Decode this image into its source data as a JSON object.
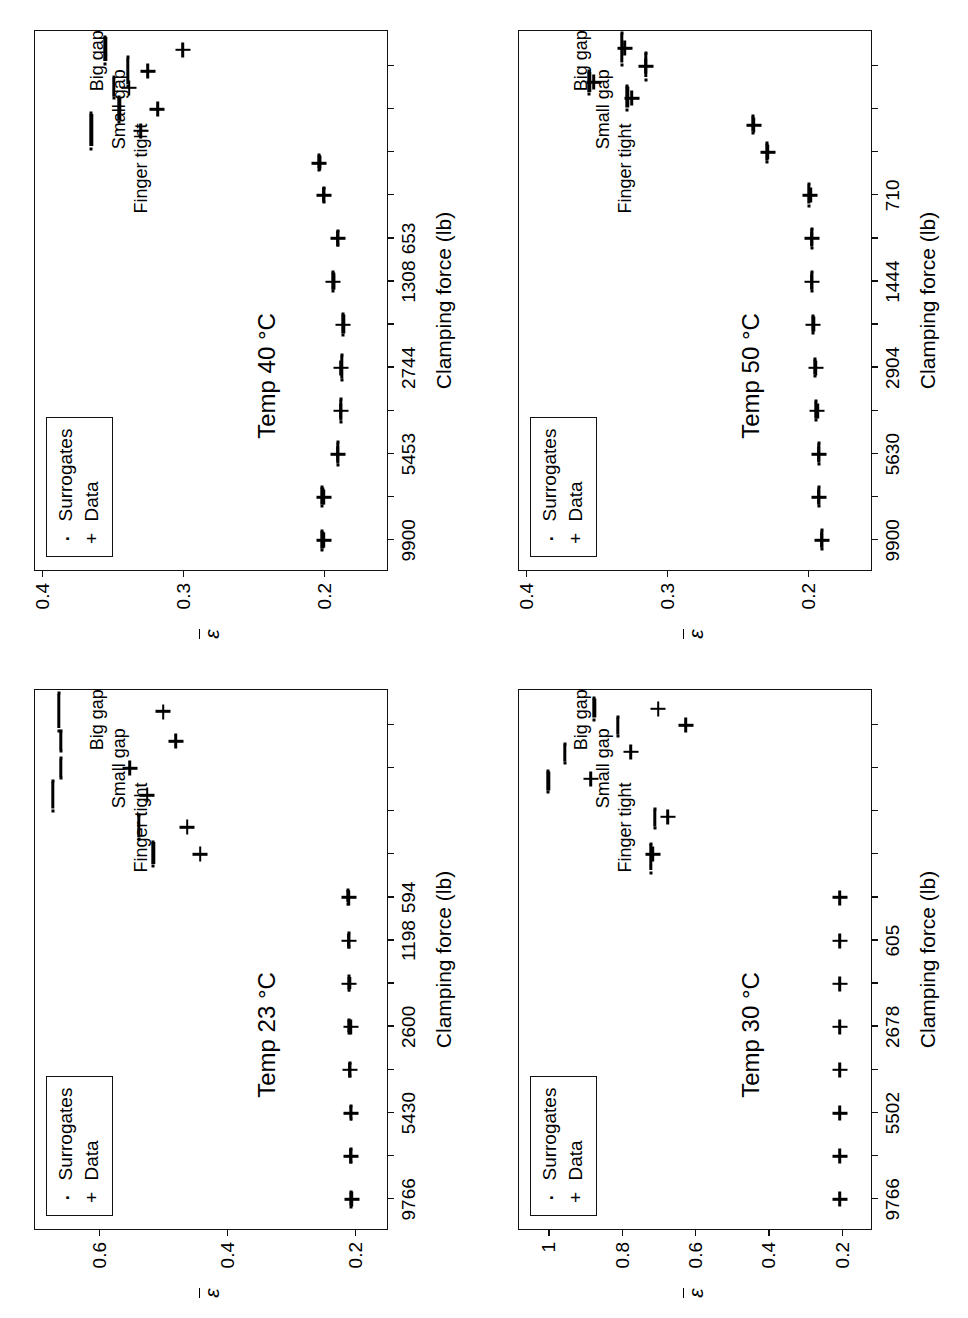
{
  "figure": {
    "layout": "2x2 grid of scatter panels, page rotated 90 degrees",
    "axis_title_x": "Clamping force (lb)",
    "axis_title_y": "ε",
    "legend": {
      "surrogates_label": "Surrogates",
      "data_label": "Data",
      "surrogates_marker": "dot-marker-icon",
      "data_marker": "plus-marker-icon"
    },
    "annotations": {
      "finger_tight": "Finger tight",
      "small_gap": "Small gap",
      "big_gap": "Big gap"
    }
  },
  "chart_data": [
    {
      "id": "temp-30",
      "type": "scatter",
      "title": "Temp 30 °C",
      "xlabel": "Clamping force (lb)",
      "ylabel": "ε",
      "grid": false,
      "legend_position": "top-left",
      "x_tick_labels": [
        "9766",
        "5502",
        "2678",
        "605"
      ],
      "x_tick_positions": [
        0.055,
        0.215,
        0.375,
        0.535
      ],
      "y_tick_labels": [
        "1",
        "0.8",
        "0.6",
        "0.4",
        "0.2"
      ],
      "ylim": [
        0.12,
        1.08
      ],
      "series": [
        {
          "name": "Data",
          "points": [
            {
              "x": 0.055,
              "y": 0.205
            },
            {
              "x": 0.135,
              "y": 0.205
            },
            {
              "x": 0.215,
              "y": 0.205
            },
            {
              "x": 0.295,
              "y": 0.205
            },
            {
              "x": 0.375,
              "y": 0.205
            },
            {
              "x": 0.455,
              "y": 0.205
            },
            {
              "x": 0.535,
              "y": 0.205
            },
            {
              "x": 0.615,
              "y": 0.205
            },
            {
              "x": 0.695,
              "y": 0.715
            },
            {
              "x": 0.765,
              "y": 0.675
            },
            {
              "x": 0.835,
              "y": 0.885
            },
            {
              "x": 0.885,
              "y": 0.775
            },
            {
              "x": 0.935,
              "y": 0.625
            },
            {
              "x": 0.965,
              "y": 0.7
            }
          ]
        },
        {
          "name": "Surrogates",
          "points": [
            {
              "x": 0.69,
              "y": 0.72,
              "w": 26
            },
            {
              "x": 0.762,
              "y": 0.71,
              "w": 17
            },
            {
              "x": 0.832,
              "y": 1.0,
              "w": 19
            },
            {
              "x": 0.884,
              "y": 0.955,
              "w": 17
            },
            {
              "x": 0.934,
              "y": 0.81,
              "w": 17
            },
            {
              "x": 0.966,
              "y": 0.875,
              "w": 19
            }
          ]
        }
      ]
    },
    {
      "id": "temp-50",
      "type": "scatter",
      "title": "Temp 50 °C",
      "xlabel": "Clamping force (lb)",
      "ylabel": "ε",
      "grid": false,
      "legend_position": "top-left",
      "x_tick_labels": [
        "9900",
        "5630",
        "2904",
        "1444",
        "710"
      ],
      "x_tick_positions": [
        0.055,
        0.215,
        0.375,
        0.535,
        0.695
      ],
      "y_tick_labels": [
        "0.4",
        "0.3",
        "0.2"
      ],
      "ylim": [
        0.155,
        0.405
      ],
      "series": [
        {
          "name": "Data",
          "points": [
            {
              "x": 0.055,
              "y": 0.19
            },
            {
              "x": 0.135,
              "y": 0.192
            },
            {
              "x": 0.215,
              "y": 0.192
            },
            {
              "x": 0.295,
              "y": 0.193
            },
            {
              "x": 0.375,
              "y": 0.194
            },
            {
              "x": 0.455,
              "y": 0.196
            },
            {
              "x": 0.535,
              "y": 0.197
            },
            {
              "x": 0.615,
              "y": 0.197
            },
            {
              "x": 0.695,
              "y": 0.198
            },
            {
              "x": 0.775,
              "y": 0.228
            },
            {
              "x": 0.825,
              "y": 0.238
            },
            {
              "x": 0.875,
              "y": 0.325
            },
            {
              "x": 0.905,
              "y": 0.352
            },
            {
              "x": 0.935,
              "y": 0.315
            },
            {
              "x": 0.968,
              "y": 0.33
            }
          ]
        },
        {
          "name": "Surrogates",
          "points": [
            {
              "x": 0.057,
              "y": 0.19,
              "w": 17
            },
            {
              "x": 0.137,
              "y": 0.192,
              "w": 17
            },
            {
              "x": 0.217,
              "y": 0.192,
              "w": 19
            },
            {
              "x": 0.297,
              "y": 0.194,
              "w": 17
            },
            {
              "x": 0.377,
              "y": 0.195,
              "w": 15
            },
            {
              "x": 0.457,
              "y": 0.196,
              "w": 15
            },
            {
              "x": 0.537,
              "y": 0.197,
              "w": 17
            },
            {
              "x": 0.617,
              "y": 0.197,
              "w": 17
            },
            {
              "x": 0.697,
              "y": 0.199,
              "w": 19
            },
            {
              "x": 0.775,
              "y": 0.229,
              "w": 17
            },
            {
              "x": 0.827,
              "y": 0.239,
              "w": 15
            },
            {
              "x": 0.877,
              "y": 0.328,
              "w": 21
            },
            {
              "x": 0.906,
              "y": 0.355,
              "w": 20
            },
            {
              "x": 0.936,
              "y": 0.315,
              "w": 24
            },
            {
              "x": 0.968,
              "y": 0.332,
              "w": 29
            }
          ]
        }
      ]
    },
    {
      "id": "temp-23",
      "type": "scatter",
      "title": "Temp 23 °C",
      "xlabel": "Clamping force (lb)",
      "ylabel": "ε",
      "grid": false,
      "legend_position": "top-left",
      "x_tick_labels": [
        "9766",
        "5430",
        "2600",
        "1198",
        "594"
      ],
      "x_tick_positions": [
        0.055,
        0.215,
        0.375,
        0.535,
        0.615
      ],
      "y_tick_labels": [
        "0.6",
        "0.4",
        "0.2"
      ],
      "ylim": [
        0.15,
        0.7
      ],
      "series": [
        {
          "name": "Data",
          "points": [
            {
              "x": 0.055,
              "y": 0.205
            },
            {
              "x": 0.135,
              "y": 0.207
            },
            {
              "x": 0.215,
              "y": 0.206
            },
            {
              "x": 0.295,
              "y": 0.208
            },
            {
              "x": 0.375,
              "y": 0.207
            },
            {
              "x": 0.455,
              "y": 0.209
            },
            {
              "x": 0.535,
              "y": 0.21
            },
            {
              "x": 0.615,
              "y": 0.21
            },
            {
              "x": 0.695,
              "y": 0.442
            },
            {
              "x": 0.745,
              "y": 0.462
            },
            {
              "x": 0.805,
              "y": 0.525
            },
            {
              "x": 0.855,
              "y": 0.552
            },
            {
              "x": 0.905,
              "y": 0.48
            },
            {
              "x": 0.96,
              "y": 0.5
            }
          ]
        },
        {
          "name": "Surrogates",
          "points": [
            {
              "x": 0.056,
              "y": 0.207,
              "w": 13
            },
            {
              "x": 0.137,
              "y": 0.207,
              "w": 11
            },
            {
              "x": 0.217,
              "y": 0.207,
              "w": 12
            },
            {
              "x": 0.297,
              "y": 0.208,
              "w": 12
            },
            {
              "x": 0.377,
              "y": 0.209,
              "w": 12
            },
            {
              "x": 0.457,
              "y": 0.209,
              "w": 12
            },
            {
              "x": 0.537,
              "y": 0.21,
              "w": 12
            },
            {
              "x": 0.617,
              "y": 0.211,
              "w": 12
            },
            {
              "x": 0.697,
              "y": 0.515,
              "w": 22
            },
            {
              "x": 0.747,
              "y": 0.538,
              "w": 22
            },
            {
              "x": 0.806,
              "y": 0.672,
              "w": 27
            },
            {
              "x": 0.856,
              "y": 0.66,
              "w": 18
            },
            {
              "x": 0.906,
              "y": 0.66,
              "w": 18
            },
            {
              "x": 0.961,
              "y": 0.663,
              "w": 34
            }
          ]
        }
      ]
    },
    {
      "id": "temp-40",
      "type": "scatter",
      "title": "Temp 40 °C",
      "xlabel": "Clamping force (lb)",
      "ylabel": "ε",
      "grid": false,
      "legend_position": "top-left",
      "x_tick_labels": [
        "9900",
        "5453",
        "2744",
        "1308",
        "653"
      ],
      "x_tick_positions": [
        0.055,
        0.215,
        0.375,
        0.535,
        0.615
      ],
      "y_tick_labels": [
        "0.4",
        "0.3",
        "0.2"
      ],
      "ylim": [
        0.155,
        0.405
      ],
      "series": [
        {
          "name": "Data",
          "points": [
            {
              "x": 0.055,
              "y": 0.2
            },
            {
              "x": 0.135,
              "y": 0.2
            },
            {
              "x": 0.215,
              "y": 0.19
            },
            {
              "x": 0.295,
              "y": 0.188
            },
            {
              "x": 0.375,
              "y": 0.188
            },
            {
              "x": 0.455,
              "y": 0.186
            },
            {
              "x": 0.535,
              "y": 0.193
            },
            {
              "x": 0.615,
              "y": 0.19
            },
            {
              "x": 0.695,
              "y": 0.2
            },
            {
              "x": 0.755,
              "y": 0.203
            },
            {
              "x": 0.815,
              "y": 0.33
            },
            {
              "x": 0.855,
              "y": 0.318
            },
            {
              "x": 0.895,
              "y": 0.338
            },
            {
              "x": 0.925,
              "y": 0.325
            },
            {
              "x": 0.965,
              "y": 0.3
            }
          ]
        },
        {
          "name": "Surrogates",
          "points": [
            {
              "x": 0.056,
              "y": 0.201,
              "w": 17
            },
            {
              "x": 0.137,
              "y": 0.201,
              "w": 17
            },
            {
              "x": 0.217,
              "y": 0.19,
              "w": 21
            },
            {
              "x": 0.297,
              "y": 0.188,
              "w": 21
            },
            {
              "x": 0.377,
              "y": 0.187,
              "w": 23
            },
            {
              "x": 0.457,
              "y": 0.186,
              "w": 19
            },
            {
              "x": 0.537,
              "y": 0.193,
              "w": 17
            },
            {
              "x": 0.617,
              "y": 0.19,
              "w": 13
            },
            {
              "x": 0.697,
              "y": 0.2,
              "w": 13
            },
            {
              "x": 0.757,
              "y": 0.203,
              "w": 13
            },
            {
              "x": 0.817,
              "y": 0.365,
              "w": 32
            },
            {
              "x": 0.856,
              "y": 0.345,
              "w": 23
            },
            {
              "x": 0.896,
              "y": 0.349,
              "w": 19
            },
            {
              "x": 0.926,
              "y": 0.339,
              "w": 26
            },
            {
              "x": 0.966,
              "y": 0.355,
              "w": 24
            }
          ]
        }
      ]
    }
  ]
}
